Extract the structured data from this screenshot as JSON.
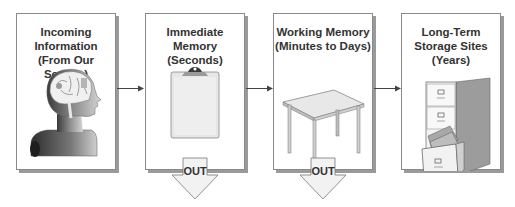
{
  "diagram": {
    "stages": [
      {
        "id": "incoming",
        "title": "Incoming\nInformation\n(From Our Senses)",
        "icon": "human-head-brain-icon"
      },
      {
        "id": "immediate",
        "title": "Immediate Memory\n(Seconds)",
        "icon": "clipboard-icon"
      },
      {
        "id": "working",
        "title": "Working Memory\n(Minutes to Days)",
        "icon": "table-icon"
      },
      {
        "id": "longterm",
        "title": "Long-Term\nStorage Sites\n(Years)",
        "icon": "file-cabinet-icon"
      }
    ],
    "out_arrows": [
      {
        "from": "immediate",
        "label": "OUT"
      },
      {
        "from": "working",
        "label": "OUT"
      }
    ],
    "connections": [
      {
        "from": "incoming",
        "to": "immediate"
      },
      {
        "from": "immediate",
        "to": "working"
      },
      {
        "from": "working",
        "to": "longterm"
      }
    ]
  },
  "colors": {
    "border": "#8a8a8a",
    "shadow": "#9a9a9a",
    "text": "#333333",
    "arrow": "#444444",
    "out_fill": "#f2f2f2"
  }
}
